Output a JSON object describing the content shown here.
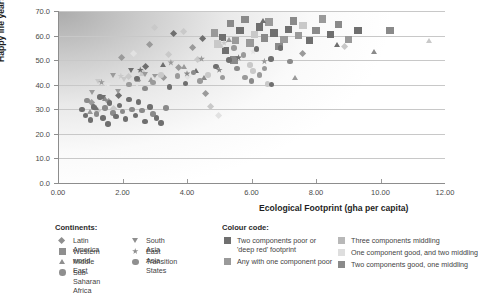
{
  "chart_data": {
    "type": "scatter",
    "title": "",
    "xlabel": "Ecological Footprint (gha per capita)",
    "ylabel": "Happy life years",
    "xlim": [
      0,
      12
    ],
    "ylim": [
      0,
      70
    ],
    "xticks": [
      "0.00",
      "2.00",
      "4.00",
      "6.00",
      "8.00",
      "10.00",
      "12.00"
    ],
    "yticks": [
      "0.0",
      "10.0",
      "20.0",
      "30.0",
      "40.0",
      "50.0",
      "60.0",
      "70.0"
    ],
    "grid": "horizontal",
    "legend_position": "below",
    "background_note": "diagonal grey gradient shading from dark at upper-left fading to white toward lower-right",
    "series": [
      {
        "name": "Latin America",
        "marker": "diamond",
        "points": [
          [
            1.05,
            32.6
          ],
          [
            1.25,
            29.0
          ],
          [
            1.5,
            38.3
          ],
          [
            1.6,
            33.0
          ],
          [
            1.75,
            30.0
          ],
          [
            1.9,
            35.2
          ],
          [
            2.0,
            50.6
          ],
          [
            2.2,
            43.0
          ],
          [
            2.35,
            52.2
          ],
          [
            2.5,
            41.5
          ],
          [
            2.6,
            45.0
          ],
          [
            2.75,
            47.0
          ],
          [
            2.85,
            55.9
          ],
          [
            3.0,
            62.8
          ],
          [
            3.15,
            44.0
          ],
          [
            3.3,
            42.6
          ],
          [
            3.45,
            52.0
          ],
          [
            3.6,
            60.6
          ],
          [
            3.75,
            46.5
          ],
          [
            3.9,
            61.5
          ],
          [
            4.05,
            43.0
          ],
          [
            4.2,
            54.8
          ],
          [
            4.35,
            49.8
          ],
          [
            4.5,
            58.4
          ],
          [
            4.6,
            36.2
          ],
          [
            4.75,
            31.0
          ],
          [
            5.0,
            27.0
          ],
          [
            7.6,
            52.5
          ],
          [
            8.9,
            55.1
          ]
        ]
      },
      {
        "name": "Western world",
        "marker": "square",
        "points": [
          [
            5.1,
            59.2
          ],
          [
            5.35,
            65.0
          ],
          [
            5.5,
            58.0
          ],
          [
            5.65,
            62.0
          ],
          [
            5.8,
            66.5
          ],
          [
            5.95,
            57.0
          ],
          [
            6.1,
            60.5
          ],
          [
            6.25,
            63.5
          ],
          [
            6.4,
            59.0
          ],
          [
            6.55,
            65.5
          ],
          [
            6.7,
            61.0
          ],
          [
            6.85,
            55.5
          ],
          [
            7.0,
            58.5
          ],
          [
            7.15,
            62.5
          ],
          [
            7.3,
            66.0
          ],
          [
            7.45,
            60.0
          ],
          [
            7.6,
            64.0
          ],
          [
            7.8,
            58.0
          ],
          [
            8.0,
            62.0
          ],
          [
            8.2,
            66.8
          ],
          [
            8.45,
            60.5
          ],
          [
            8.7,
            64.5
          ],
          [
            9.0,
            58.5
          ],
          [
            9.3,
            62.0
          ],
          [
            10.3,
            62.0
          ],
          [
            4.85,
            61.0
          ],
          [
            4.95,
            56.5
          ],
          [
            5.2,
            54.0
          ],
          [
            5.45,
            50.0
          ]
        ]
      },
      {
        "name": "Middle East",
        "marker": "triangle",
        "points": [
          [
            1.0,
            28.8
          ],
          [
            1.2,
            30.3
          ],
          [
            1.45,
            34.0
          ],
          [
            2.6,
            44.3
          ],
          [
            2.9,
            42.0
          ],
          [
            3.25,
            48.0
          ],
          [
            3.9,
            47.0
          ],
          [
            4.3,
            45.5
          ],
          [
            4.55,
            42.8
          ],
          [
            5.05,
            55.5
          ],
          [
            5.3,
            58.0
          ],
          [
            6.35,
            66.0
          ],
          [
            7.35,
            42.7
          ],
          [
            8.65,
            56.0
          ],
          [
            9.8,
            53.2
          ],
          [
            11.5,
            57.5
          ]
        ]
      },
      {
        "name": "Sub-Saharan Africa",
        "marker": "circle",
        "points": [
          [
            0.75,
            30.0
          ],
          [
            0.85,
            27.5
          ],
          [
            0.9,
            33.5
          ],
          [
            1.0,
            25.6
          ],
          [
            1.1,
            31.0
          ],
          [
            1.2,
            28.0
          ],
          [
            1.3,
            35.0
          ],
          [
            1.4,
            26.5
          ],
          [
            1.45,
            30.5
          ],
          [
            1.55,
            24.0
          ],
          [
            1.6,
            32.5
          ],
          [
            1.7,
            28.5
          ],
          [
            1.8,
            27.0
          ],
          [
            1.9,
            31.5
          ],
          [
            2.0,
            29.0
          ],
          [
            2.1,
            26.0
          ],
          [
            2.2,
            34.0
          ],
          [
            2.3,
            30.0
          ],
          [
            2.4,
            27.5
          ],
          [
            2.5,
            33.0
          ],
          [
            2.6,
            29.5
          ],
          [
            2.7,
            25.0
          ],
          [
            2.85,
            31.0
          ],
          [
            2.95,
            28.0
          ],
          [
            3.05,
            26.5
          ],
          [
            3.2,
            24.5
          ],
          [
            3.35,
            30.5
          ]
        ]
      },
      {
        "name": "South Asia",
        "marker": "triangle-down",
        "points": [
          [
            1.05,
            36.5
          ],
          [
            1.25,
            41.0
          ],
          [
            1.4,
            34.5
          ],
          [
            1.55,
            39.5
          ],
          [
            1.7,
            43.5
          ],
          [
            1.85,
            37.0
          ],
          [
            2.05,
            42.0
          ],
          [
            2.25,
            45.5
          ],
          [
            2.45,
            40.0
          ],
          [
            2.7,
            44.0
          ],
          [
            3.0,
            43.0
          ]
        ]
      },
      {
        "name": "East Asia",
        "marker": "star",
        "points": [
          [
            1.35,
            41.0
          ],
          [
            1.95,
            43.5
          ],
          [
            2.55,
            46.0
          ],
          [
            3.05,
            42.5
          ],
          [
            3.5,
            49.0
          ],
          [
            4.0,
            44.5
          ],
          [
            4.45,
            50.5
          ],
          [
            5.15,
            57.0
          ],
          [
            5.6,
            51.0
          ],
          [
            6.05,
            53.5
          ],
          [
            6.4,
            49.5
          ],
          [
            5.0,
            46.0
          ]
        ]
      },
      {
        "name": "Transition States",
        "marker": "circle-dark",
        "points": [
          [
            2.2,
            40.0
          ],
          [
            2.45,
            42.5
          ],
          [
            2.7,
            38.5
          ],
          [
            2.95,
            41.0
          ],
          [
            3.2,
            44.0
          ],
          [
            3.45,
            39.0
          ],
          [
            3.7,
            43.5
          ],
          [
            3.95,
            40.5
          ],
          [
            4.2,
            45.0
          ],
          [
            4.4,
            41.5
          ],
          [
            4.65,
            44.0
          ],
          [
            4.9,
            47.5
          ],
          [
            5.1,
            43.0
          ],
          [
            5.3,
            50.0
          ],
          [
            5.55,
            46.5
          ],
          [
            5.75,
            52.0
          ],
          [
            5.95,
            48.0
          ],
          [
            6.15,
            54.5
          ],
          [
            6.4,
            46.5
          ],
          [
            6.6,
            50.5
          ],
          [
            6.0,
            41.5
          ],
          [
            6.25,
            44.0
          ],
          [
            6.5,
            40.3
          ],
          [
            6.62,
            40.1
          ],
          [
            5.45,
            55.0
          ],
          [
            6.9,
            55.0
          ],
          [
            7.2,
            49.5
          ],
          [
            5.8,
            43.0
          ],
          [
            6.05,
            45.5
          ]
        ]
      }
    ]
  },
  "continents_legend": {
    "heading": "Continents:",
    "column1": [
      {
        "label": "Latin America",
        "marker": "diamond"
      },
      {
        "label": "Western world",
        "marker": "square"
      },
      {
        "label": "Middle East",
        "marker": "triangle"
      },
      {
        "label": "Sub-Saharan Africa",
        "marker": "circle"
      }
    ],
    "column2": [
      {
        "label": "South Asia",
        "marker": "triangle-down"
      },
      {
        "label": "East Asia",
        "marker": "star"
      },
      {
        "label": "Transition States",
        "marker": "circle"
      }
    ]
  },
  "colour_legend": {
    "heading": "Colour code:",
    "column1": [
      {
        "label": "Two components poor or\n'deep red' footprint",
        "swatch": "#6f6f6f"
      },
      {
        "label": "Any with one component poor",
        "swatch": "#9a9a9a"
      }
    ],
    "column2": [
      {
        "label": "Three components middling",
        "swatch": "#b8b8b8"
      },
      {
        "label": "One component good, and two middling",
        "swatch": "#dedede"
      },
      {
        "label": "Two components good, one middling",
        "swatch": "#8a8a8a"
      }
    ]
  },
  "colors": {
    "axis": "#8d8d8d",
    "grid": "#c8c8c8",
    "text": "#3a3a3a",
    "marker_dark": "#6f6f6f",
    "marker_mid": "#9a9a9a",
    "marker_light": "#c9c9c9",
    "marker_pale": "#e2e2e2"
  }
}
